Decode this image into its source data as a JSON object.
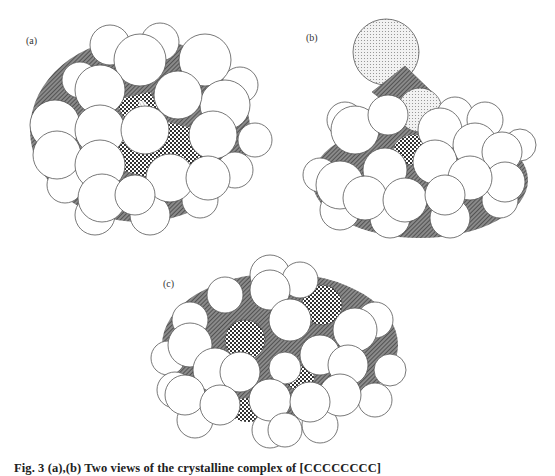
{
  "figure": {
    "panels": [
      {
        "id": "a",
        "label": "(a)"
      },
      {
        "id": "b",
        "label": "(b)"
      },
      {
        "id": "c",
        "label": "(c)"
      }
    ],
    "caption": "Fig. 3  (a),(b) Two views of the crystalline complex of [CCCCCCCC]",
    "colors": {
      "background": "#ffffff",
      "atom_fill": "#ffffff",
      "atom_stroke": "#555555",
      "shade_dark": "#6a6a6a",
      "shade_checker": "#3a3a3a",
      "shade_light_dots": "#bdbdbd"
    }
  }
}
